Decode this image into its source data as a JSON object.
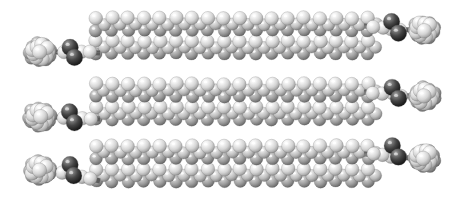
{
  "figure": {
    "render_style": "space-filling (CPK) raytraced spheres",
    "color_mode": "grayscale",
    "background_color": "#ffffff",
    "width": 466,
    "height": 202
  },
  "palette": {
    "carbon_light": "#e4e4e4",
    "carbon_light_shadow": "#9a9a9a",
    "carbon_mid": "#c8c8c8",
    "carbon_mid_shadow": "#7d7d7d",
    "heteroatom_dark": "#2b2b2b",
    "heteroatom_dark_highlight": "#8e8e8e",
    "bond_gray": "#6f6f6f",
    "outline": "#5a5a5a",
    "specular_highlight": "#ffffff"
  },
  "atom_types": [
    {
      "name": "carbon",
      "shade": "light-gray",
      "hex": "#e4e4e4",
      "radius_px": 7.5
    },
    {
      "name": "carbon-backbone",
      "shade": "mid-gray",
      "hex": "#c8c8c8",
      "radius_px": 7.0
    },
    {
      "name": "heteroatom",
      "shade": "dark",
      "hex": "#2b2b2b",
      "radius_px": 8.5
    }
  ],
  "structure": {
    "molecule_count": 3,
    "stacking": "vertical, three parallel molecular rods",
    "chains_per_molecule": 2,
    "total_chain_rows": 6,
    "chain_orientation": "horizontal",
    "description": "Three rod-shaped molecules stacked vertically; each molecule is a pair of parallel conjugated backbones (a ladder/bundle) capped at both ends by bulky globular substituent clusters attached through dark heteroatoms."
  },
  "molecules": [
    {
      "id": "molecule-top",
      "label": "Molecule 1 (top)",
      "y_center": 33,
      "chain_rows": [
        {
          "id": "chain-1a",
          "y": 24,
          "x_start": 96,
          "x_end": 368,
          "repeat_units": 17
        },
        {
          "id": "chain-1b",
          "y": 47,
          "x_start": 96,
          "x_end": 368,
          "repeat_units": 17
        }
      ],
      "end_caps": [
        {
          "side": "left",
          "cx": 40,
          "cy": 52,
          "cluster_atoms": 9,
          "label": "bulky terminal group"
        },
        {
          "side": "right",
          "cx": 424,
          "cy": 30,
          "cluster_atoms": 9,
          "label": "bulky terminal group"
        }
      ],
      "heteroatoms": [
        {
          "cx": 70,
          "cy": 47,
          "label": "dark heteroatom (left linker)"
        },
        {
          "cx": 74,
          "cy": 58,
          "label": "dark heteroatom (left linker)"
        },
        {
          "cx": 392,
          "cy": 22,
          "label": "dark heteroatom (right linker)"
        },
        {
          "cx": 398,
          "cy": 33,
          "label": "dark heteroatom (right linker)"
        }
      ]
    },
    {
      "id": "molecule-middle",
      "label": "Molecule 2 (middle)",
      "y_center": 99,
      "chain_rows": [
        {
          "id": "chain-2a",
          "y": 90,
          "x_start": 96,
          "x_end": 368,
          "repeat_units": 17
        },
        {
          "id": "chain-2b",
          "y": 113,
          "x_start": 96,
          "x_end": 368,
          "repeat_units": 17
        }
      ],
      "end_caps": [
        {
          "side": "left",
          "cx": 40,
          "cy": 117,
          "cluster_atoms": 9,
          "label": "bulky terminal group"
        },
        {
          "side": "right",
          "cx": 424,
          "cy": 96,
          "cluster_atoms": 9,
          "label": "bulky terminal group"
        }
      ],
      "heteroatoms": [
        {
          "cx": 70,
          "cy": 112,
          "label": "dark heteroatom (left linker)"
        },
        {
          "cx": 74,
          "cy": 123,
          "label": "dark heteroatom (left linker)"
        },
        {
          "cx": 392,
          "cy": 88,
          "label": "dark heteroatom (right linker)"
        },
        {
          "cx": 398,
          "cy": 99,
          "label": "dark heteroatom (right linker)"
        }
      ]
    },
    {
      "id": "molecule-bottom",
      "label": "Molecule 3 (bottom)",
      "y_center": 162,
      "chain_rows": [
        {
          "id": "chain-3a",
          "y": 152,
          "x_start": 96,
          "x_end": 368,
          "repeat_units": 17
        },
        {
          "id": "chain-3b",
          "y": 175,
          "x_start": 96,
          "x_end": 368,
          "repeat_units": 17
        }
      ],
      "end_caps": [
        {
          "side": "left",
          "cx": 40,
          "cy": 170,
          "cluster_atoms": 9,
          "label": "bulky terminal group"
        },
        {
          "side": "right",
          "cx": 424,
          "cy": 158,
          "cluster_atoms": 9,
          "label": "bulky terminal group"
        }
      ],
      "heteroatoms": [
        {
          "cx": 70,
          "cy": 165,
          "label": "dark heteroatom (left linker)"
        },
        {
          "cx": 74,
          "cy": 176,
          "label": "dark heteroatom (left linker)"
        },
        {
          "cx": 392,
          "cy": 146,
          "label": "dark heteroatom (right linker)"
        },
        {
          "cx": 398,
          "cy": 157,
          "label": "dark heteroatom (right linker)"
        }
      ]
    }
  ],
  "labels": {
    "caption": "",
    "axis_labels": [],
    "annotations": []
  }
}
